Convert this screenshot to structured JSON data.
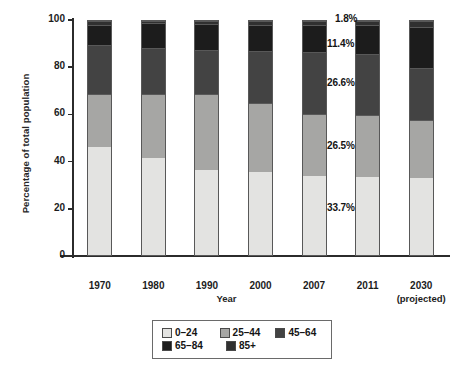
{
  "chart_data": {
    "type": "bar",
    "subtype": "stacked-bar-100",
    "title": "",
    "xlabel": "Year",
    "ylabel": "Percentage of total population",
    "ylim": [
      0,
      100
    ],
    "yticks": [
      0,
      20,
      40,
      60,
      80,
      100
    ],
    "ytick_labels": [
      "0",
      "20",
      "40",
      "60",
      "80",
      "100"
    ],
    "grid": false,
    "legend_position": "bottom",
    "categories": [
      "1970",
      "1980",
      "1990",
      "2000",
      "2007",
      "2011",
      "2030"
    ],
    "category_sublabels": [
      "",
      "",
      "",
      "",
      "",
      "",
      "(projected)"
    ],
    "series": [
      {
        "name": "0–24",
        "color": "#e3e3e1",
        "values": [
          46.0,
          41.5,
          36.5,
          35.3,
          33.7,
          33.4,
          32.8
        ]
      },
      {
        "name": "25–44",
        "color": "#a6a6a4",
        "values": [
          23.0,
          27.5,
          32.5,
          29.8,
          26.5,
          26.3,
          25.0
        ]
      },
      {
        "name": "45–64",
        "color": "#434343",
        "values": [
          20.6,
          19.6,
          18.6,
          22.1,
          26.6,
          26.4,
          22.1
        ]
      },
      {
        "name": "65–84",
        "color": "#1c1c1c",
        "values": [
          8.7,
          10.4,
          11.2,
          11.3,
          11.4,
          12.0,
          17.7
        ]
      },
      {
        "name": "85+",
        "color": "#303030",
        "values": [
          1.7,
          1.0,
          1.2,
          1.5,
          1.8,
          1.9,
          2.4
        ]
      }
    ],
    "annotations": [
      {
        "text": "1.8%",
        "series": "85+",
        "category": "2007",
        "x": 335,
        "y": 13
      },
      {
        "text": "11.4%",
        "series": "65–84",
        "category": "2007",
        "x": 327,
        "y": 38
      },
      {
        "text": "26.6%",
        "series": "45–64",
        "category": "2007",
        "x": 327,
        "y": 77
      },
      {
        "text": "26.5%",
        "series": "25–44",
        "category": "2007",
        "x": 327,
        "y": 140
      },
      {
        "text": "33.7%",
        "series": "0–24",
        "category": "2007",
        "x": 327,
        "y": 202
      }
    ],
    "legend_entries": [
      "0–24",
      "25–44",
      "45–64",
      "65–84",
      "85+"
    ]
  }
}
